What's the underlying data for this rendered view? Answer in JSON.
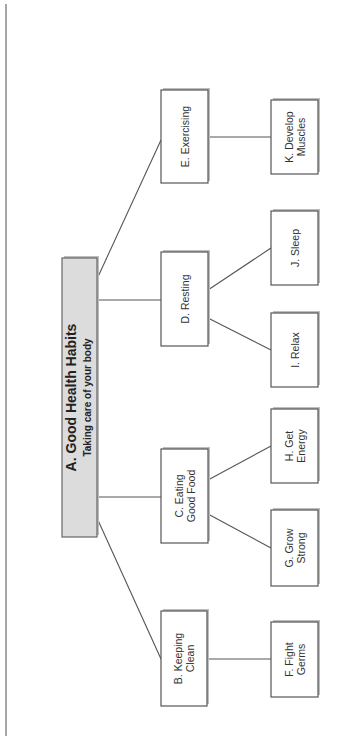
{
  "diagram": {
    "type": "tree",
    "orientation": "rotated-90-ccw",
    "colors": {
      "root_fill": "#dcdcdc",
      "node_fill": "#ffffff",
      "stroke": "#555555"
    },
    "root": {
      "id": "A",
      "title": "A. Good Health Habits",
      "subtitle": "Taking care of your body"
    },
    "nodes": [
      {
        "id": "B",
        "lines": [
          "B. Keeping",
          "Clean"
        ],
        "parent": "A"
      },
      {
        "id": "C",
        "lines": [
          "C. Eating",
          "Good Food"
        ],
        "parent": "A"
      },
      {
        "id": "D",
        "lines": [
          "D. Resting"
        ],
        "parent": "A"
      },
      {
        "id": "E",
        "lines": [
          "E. Exercising"
        ],
        "parent": "A"
      },
      {
        "id": "F",
        "lines": [
          "F. Fight",
          "Germs"
        ],
        "parent": "B"
      },
      {
        "id": "G",
        "lines": [
          "G. Grow",
          "Strong"
        ],
        "parent": "C"
      },
      {
        "id": "H",
        "lines": [
          "H. Get",
          "Energy"
        ],
        "parent": "C"
      },
      {
        "id": "I",
        "lines": [
          "I. Relax"
        ],
        "parent": "D"
      },
      {
        "id": "J",
        "lines": [
          "J. Sleep"
        ],
        "parent": "D"
      },
      {
        "id": "K",
        "lines": [
          "K. Develop",
          "Muscles"
        ],
        "parent": "E"
      }
    ]
  }
}
